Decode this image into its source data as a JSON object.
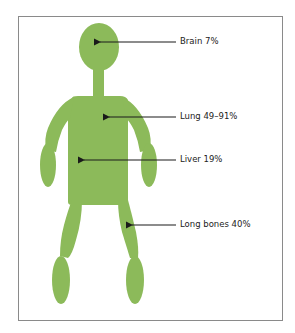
{
  "diagram": {
    "type": "anatomical-silhouette",
    "figure_color": "#8cba5a",
    "frame_color": "#8a8a8a",
    "arrow_color": "#1a1a1a",
    "labels": [
      {
        "id": "brain",
        "text": "Brain 7%",
        "organ": "Brain",
        "value": "7%"
      },
      {
        "id": "lung",
        "text": "Lung 49–91%",
        "organ": "Lung",
        "value": "49–91%"
      },
      {
        "id": "liver",
        "text": "Liver 19%",
        "organ": "Liver",
        "value": "19%"
      },
      {
        "id": "long-bones",
        "text": "Long bones 40%",
        "organ": "Long bones",
        "value": "40%"
      }
    ]
  }
}
